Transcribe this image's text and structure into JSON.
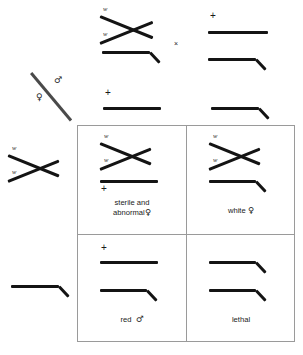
{
  "figure": {
    "type": "genetics-punnett-square",
    "cross_symbol": "×",
    "male_symbol": "♂",
    "female_symbol": "♀"
  },
  "axis": {
    "male_label": "♂",
    "female_label": "♀"
  },
  "parents": {
    "female_parent": {
      "name": "attached-X white female",
      "alleles": [
        "w",
        "w"
      ],
      "chromosomes": [
        "attached-X",
        "Y"
      ]
    },
    "male_parent": {
      "name": "wild-type red male",
      "alleles": [
        "+"
      ],
      "chromosomes": [
        "X",
        "Y"
      ]
    }
  },
  "gametes": {
    "column_headers": [
      {
        "allele": "+",
        "chromosome": "X",
        "name": "X-plus-gamete"
      },
      {
        "allele": "",
        "chromosome": "Y",
        "name": "Y-gamete"
      }
    ],
    "row_headers": [
      {
        "allele": "w",
        "allele2": "w",
        "chromosome": "attached-X",
        "name": "attached-X-w-gamete"
      },
      {
        "allele": "",
        "chromosome": "Y",
        "name": "Y-gamete"
      }
    ]
  },
  "cells": [
    {
      "id": "cell-top-left",
      "label": "sterile and",
      "label2": "abnormal",
      "sex": "♀",
      "genotype": [
        "w",
        "w",
        "+"
      ],
      "chromosomes": [
        "attached-X",
        "X"
      ]
    },
    {
      "id": "cell-top-right",
      "label": "white",
      "label2": "",
      "sex": "♀",
      "genotype": [
        "w",
        "w"
      ],
      "chromosomes": [
        "attached-X",
        "Y"
      ]
    },
    {
      "id": "cell-bottom-left",
      "label": "red",
      "label2": "",
      "sex": "♂",
      "genotype": [
        "+"
      ],
      "chromosomes": [
        "X",
        "Y"
      ]
    },
    {
      "id": "cell-bottom-right",
      "label": "lethal",
      "label2": "",
      "sex": "",
      "genotype": [],
      "chromosomes": [
        "Y",
        "Y"
      ]
    }
  ],
  "colors": {
    "ink": "#141414",
    "grid_line": "#9a9a9a",
    "background": "#ffffff"
  }
}
